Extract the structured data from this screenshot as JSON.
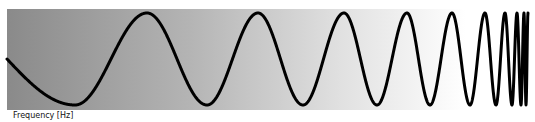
{
  "diagram": {
    "type": "chirp-signal",
    "x_axis_label": "Frequency [Hz]",
    "background": {
      "from": "#8a8a8a",
      "to": "#ffffff",
      "direction": "left-to-right"
    },
    "wave_color": "#000000",
    "extrema_x": [
      7,
      75,
      147,
      207,
      258,
      303,
      344,
      377,
      407,
      430,
      452,
      470,
      485,
      496,
      505,
      512,
      517,
      521,
      524,
      526,
      528
    ],
    "start_phase": "mid-level, descending"
  }
}
